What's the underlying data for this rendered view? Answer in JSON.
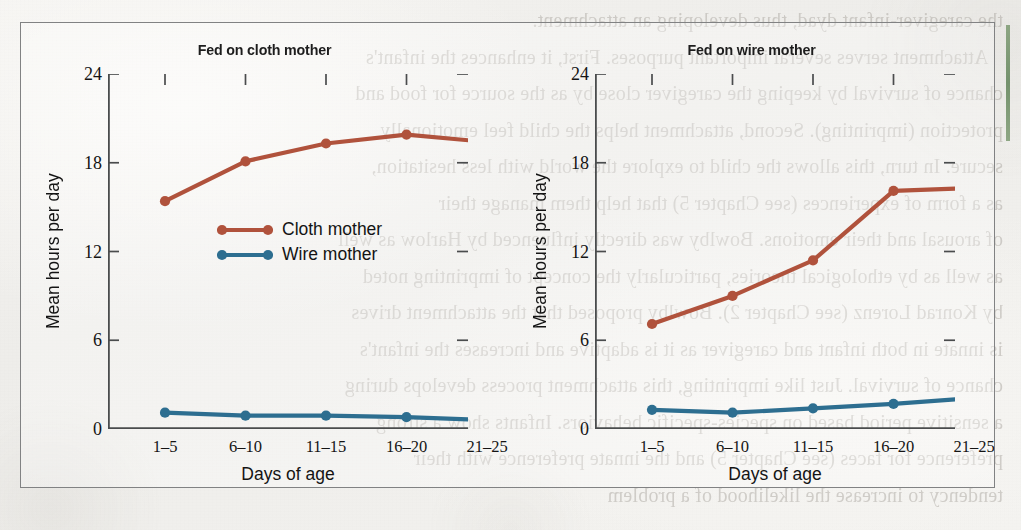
{
  "figure": {
    "panels": [
      {
        "title": "Fed on cloth mother",
        "ylabel": "Mean hours per day",
        "xlabel": "Days of age",
        "legend": [
          {
            "label": "Cloth mother",
            "color": "#b0523c"
          },
          {
            "label": "Wire mother",
            "color": "#2d6e90"
          }
        ]
      },
      {
        "title": "Fed on wire mother",
        "ylabel": "Mean hours per day",
        "xlabel": "Days of age",
        "legend": [
          {
            "label": "Cloth mother",
            "color": "#b0523c"
          },
          {
            "label": "Wire mother",
            "color": "#2d6e90"
          }
        ]
      }
    ],
    "yticks": [
      "0",
      "6",
      "12",
      "18",
      "24"
    ],
    "xticks": [
      "1–5",
      "6–10",
      "11–15",
      "16–20",
      "21–25"
    ]
  },
  "chart_data": [
    {
      "type": "line",
      "title": "Fed on cloth mother",
      "xlabel": "Days of age",
      "ylabel": "Mean hours per day",
      "categories": [
        "1-5",
        "6-10",
        "11-15",
        "16-20",
        "21-25"
      ],
      "ylim": [
        0,
        24
      ],
      "yticks": [
        0,
        6,
        12,
        18,
        24
      ],
      "grid": false,
      "legend_position": "inside-center",
      "series": [
        {
          "name": "Cloth mother",
          "color": "#b0523c",
          "values": [
            15.4,
            18.1,
            19.3,
            19.9,
            19.4
          ]
        },
        {
          "name": "Wire mother",
          "color": "#2d6e90",
          "values": [
            1.1,
            0.9,
            0.9,
            0.8,
            0.6
          ]
        }
      ]
    },
    {
      "type": "line",
      "title": "Fed on wire mother",
      "xlabel": "Days of age",
      "ylabel": "Mean hours per day",
      "categories": [
        "1-5",
        "6-10",
        "11-15",
        "16-20",
        "21-25"
      ],
      "ylim": [
        0,
        24
      ],
      "yticks": [
        0,
        6,
        12,
        18,
        24
      ],
      "grid": false,
      "legend_position": "inside-upper-left",
      "series": [
        {
          "name": "Cloth mother",
          "color": "#b0523c",
          "values": [
            7.1,
            9.0,
            11.4,
            16.1,
            16.3
          ]
        },
        {
          "name": "Wire mother",
          "color": "#2d6e90",
          "values": [
            1.3,
            1.1,
            1.4,
            1.7,
            2.1
          ]
        }
      ]
    }
  ],
  "bleed_through_text": {
    "lines": [
      "the caregiver-infant dyad, thus developing an attachment.",
      "   Attachment serves several important purposes. First, it enhances the infant's",
      "chance of survival by keeping the caregiver close by as the source for food and",
      "protection (imprinting). Second, attachment helps the child feel emotionally",
      "secure. In turn, this allows the child to explore the world with less hesitation,",
      "as a form of experiences (see Chapter 5) that help them manage their",
      "of arousal and their emotions. Bowlby was directly influenced by Harlow as well",
      "as well as by ethological theories, particularly the concept of imprinting noted",
      "by Konrad Lorenz (see Chapter 2). Bowlby proposed that the attachment drives",
      "is innate in both infant and caregiver as it is adaptive and increases the infant's",
      "chance of survival. Just like imprinting, this attachment process develops during",
      "a sensitive period based on species-specific behaviors. Infants show a strong",
      "preference for faces (see Chapter 5) and the innate preference with their",
      "tendency to increase the likelihood of a problem"
    ]
  },
  "decor": {
    "green_rule_color": "#5f8257",
    "frame_color": "#57595a"
  }
}
